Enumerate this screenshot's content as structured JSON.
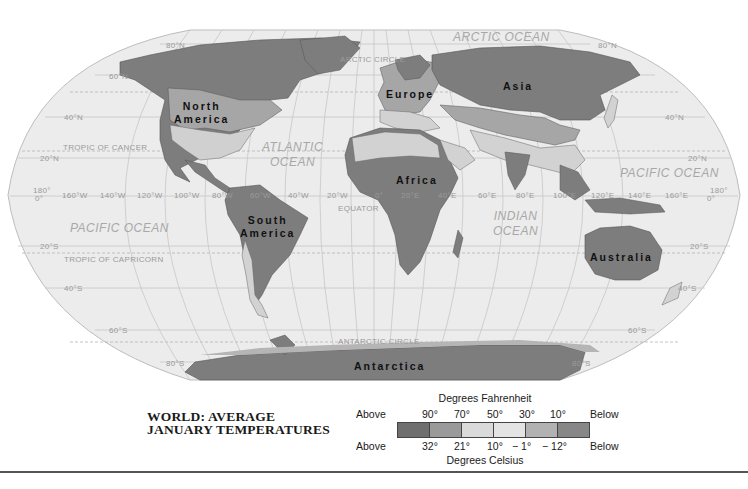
{
  "map": {
    "title_line1": "WORLD: AVERAGE",
    "title_line2": "JANUARY TEMPERATURES",
    "projection": "Robinson-like world map",
    "continents": {
      "north_america_1": "North",
      "north_america_2": "America",
      "south_america_1": "South",
      "south_america_2": "America",
      "europe": "Europe",
      "asia": "Asia",
      "africa": "Africa",
      "australia": "Australia",
      "antarctica": "Antarctica"
    },
    "oceans": {
      "arctic": "ARCTIC OCEAN",
      "atlantic_1": "ATLANTIC",
      "atlantic_2": "OCEAN",
      "pacific_east": "PACIFIC OCEAN",
      "pacific_west": "PACIFIC OCEAN",
      "indian_1": "INDIAN",
      "indian_2": "OCEAN"
    },
    "lines": {
      "arctic_circle": "ARCTIC CIRCLE",
      "tropic_cancer": "TROPIC OF CANCER",
      "equator": "EQUATOR",
      "tropic_capricorn": "TROPIC OF CAPRICORN",
      "antarctic_circle": "ANTARCTIC CIRCLE"
    },
    "latitudes": {
      "n80": "80°N",
      "n60": "60°N",
      "n40": "40°N",
      "n20": "20°N",
      "zero": "0°",
      "s20": "20°S",
      "s40": "40°S",
      "s60": "60°S",
      "s80": "80°S"
    },
    "longitudes": {
      "w160": "160°W",
      "w140": "140°W",
      "w120": "120°W",
      "w100": "100°W",
      "w80": "80°W",
      "w60": "60°W",
      "w40": "40°W",
      "w20": "20°W",
      "zero": "0°",
      "e20": "20°E",
      "e40": "40°E",
      "e60": "60°E",
      "e80": "80°E",
      "e100": "100°E",
      "e120": "120°E",
      "e140": "140°E",
      "e160": "160°E",
      "d180": "180°"
    }
  },
  "legend": {
    "fahrenheit_caption": "Degrees Fahrenheit",
    "celsius_caption": "Degrees Celsius",
    "f_above": "Above",
    "f_below": "Below",
    "f_ticks": [
      "90°",
      "70°",
      "50°",
      "30°",
      "10°"
    ],
    "c_above": "Above",
    "c_below": "Below",
    "c_ticks": [
      "32°",
      "21°",
      "10°",
      "− 1°",
      "− 12°"
    ],
    "swatch_colors": [
      "#6f6f6f",
      "#9a9a9a",
      "#dadada",
      "#e4e4e4",
      "#b2b2b2",
      "#878787"
    ]
  },
  "colors": {
    "ocean": "#ececec",
    "graticule": "#c2c2c2",
    "land_dark": "#7d7d7d",
    "land_mid": "#a3a3a3",
    "land_light": "#d2d2d2"
  }
}
